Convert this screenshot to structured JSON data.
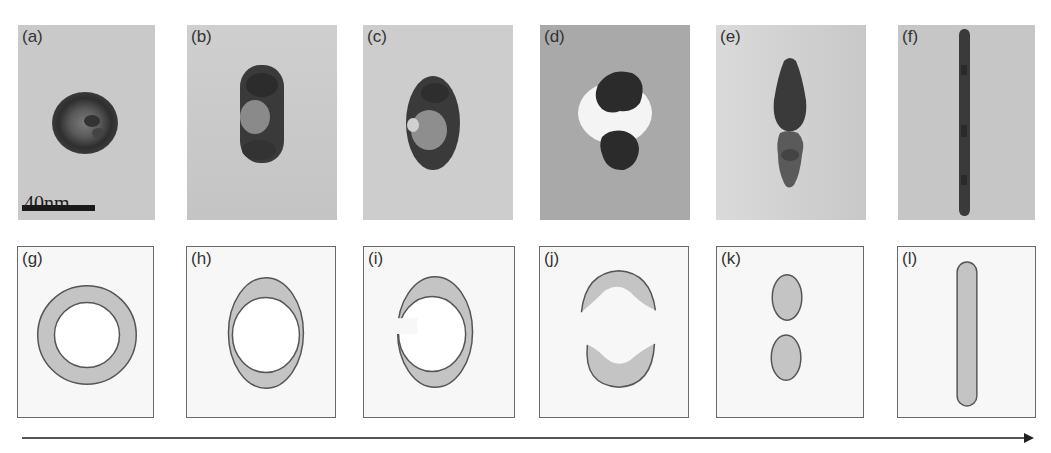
{
  "figure": {
    "top_row": {
      "description": "TEM micrographs",
      "panels": [
        {
          "label": "(a)",
          "shape": "sphere-core-shell"
        },
        {
          "label": "(b)",
          "shape": "elongated-core-shell"
        },
        {
          "label": "(c)",
          "shape": "elongated-shell-opening"
        },
        {
          "label": "(d)",
          "shape": "split-two-caps"
        },
        {
          "label": "(e)",
          "shape": "two-fused-particles"
        },
        {
          "label": "(f)",
          "shape": "nanorod"
        }
      ],
      "scale_bar": {
        "label": "40nm"
      }
    },
    "bottom_row": {
      "description": "Schematic shapes",
      "panels": [
        {
          "label": "(g)",
          "shape": "ring"
        },
        {
          "label": "(h)",
          "shape": "elliptical-ring"
        },
        {
          "label": "(i)",
          "shape": "open-crescent-ring"
        },
        {
          "label": "(j)",
          "shape": "two-caps"
        },
        {
          "label": "(k)",
          "shape": "two-ellipses"
        },
        {
          "label": "(l)",
          "shape": "rod"
        }
      ]
    },
    "arrow": {
      "direction": "right",
      "meaning": "evolution progression"
    },
    "colors": {
      "tem_background": "#c9c9c9",
      "tem_background_dark": "#a9a9a9",
      "particle_dark": "#3a3a3a",
      "schematic_fill": "#c4c4c4",
      "schematic_outline": "#555555",
      "schematic_background": "#f7f7f7"
    }
  }
}
